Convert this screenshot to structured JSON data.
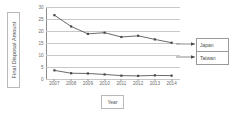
{
  "chart_data": {
    "type": "line",
    "title": "",
    "xlabel": "Year",
    "ylabel": "Final Disposal Amount",
    "categories": [
      "2007",
      "2008",
      "2009",
      "2010",
      "2011",
      "2012",
      "2013",
      "2014"
    ],
    "x": [
      2007,
      2008,
      2009,
      2010,
      2011,
      2012,
      2013,
      2014
    ],
    "ylim": [
      0,
      30
    ],
    "yticks": [
      0,
      5,
      10,
      15,
      20,
      25,
      30
    ],
    "ytick_labels": [
      "0",
      "5",
      "10",
      "15",
      "20",
      "25",
      "30"
    ],
    "grid": true,
    "legend_position": "right",
    "series": [
      {
        "name": "Japan",
        "color": "#595959",
        "marker": "square",
        "values": [
          26.6,
          21.9,
          18.8,
          19.3,
          17.5,
          18.0,
          16.5,
          15.1
        ]
      },
      {
        "name": "Taiwan",
        "color": "#595959",
        "marker": "square",
        "values": [
          3.6,
          2.4,
          2.3,
          1.9,
          1.4,
          1.3,
          1.5,
          1.4
        ]
      }
    ]
  },
  "axes": {
    "ylabel_box": {
      "text": "Final Disposal Amount"
    },
    "xlabel_box": {
      "text": "Year"
    }
  },
  "legend": {
    "entries": [
      {
        "label": "Japan"
      },
      {
        "label": "Taiwan"
      }
    ]
  },
  "colors": {
    "line": "#595959",
    "marker": "#4a4a4a",
    "gridline": "#c8c8c8",
    "axis": "#8c8c8c",
    "box_border": "#b9b9b9",
    "legend_border": "#9a9a9a",
    "text": "#6b6b6b",
    "background": "#ffffff"
  }
}
